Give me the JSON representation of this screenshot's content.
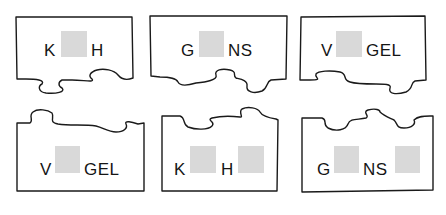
{
  "diagram": {
    "title": "",
    "colors": {
      "outline": "#1a1a1a",
      "blank_box": "#d9d9d9",
      "text": "#151515",
      "background": "#ffffff"
    },
    "top_row": [
      {
        "id": "top-1",
        "segments": [
          "K",
          "H"
        ],
        "blanks": 1,
        "edge_with_tabs": "bottom"
      },
      {
        "id": "top-2",
        "segments": [
          "G",
          "NS"
        ],
        "blanks": 1,
        "edge_with_tabs": "bottom"
      },
      {
        "id": "top-3",
        "segments": [
          "V",
          "GEL"
        ],
        "blanks": 1,
        "edge_with_tabs": "bottom"
      }
    ],
    "bottom_row": [
      {
        "id": "bottom-1",
        "segments": [
          "V",
          "GEL"
        ],
        "blanks": 1,
        "edge_with_tabs": "top"
      },
      {
        "id": "bottom-2",
        "segments": [
          "K",
          "H"
        ],
        "blanks": 2,
        "edge_with_tabs": "top"
      },
      {
        "id": "bottom-3",
        "segments": [
          "G",
          "NS"
        ],
        "blanks": 2,
        "edge_with_tabs": "top"
      }
    ]
  }
}
